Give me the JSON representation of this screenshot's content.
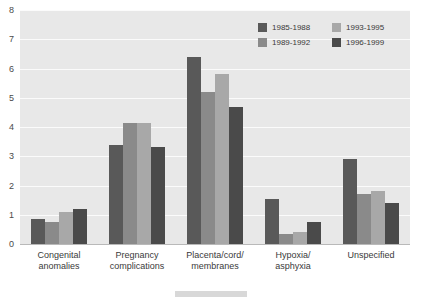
{
  "chart_data": {
    "type": "bar",
    "title": "",
    "subtitle": "",
    "xlabel": "",
    "ylabel": "",
    "ylim": [
      0,
      8
    ],
    "ytick_labels": [
      "8",
      "7",
      "6",
      "5",
      "4",
      "3",
      "2",
      "1",
      "0"
    ],
    "yticks": [
      8,
      7,
      6,
      5,
      4,
      3,
      2,
      1,
      0
    ],
    "grid": true,
    "legend_position": "top-right",
    "categories": [
      "Congenital\nanomalies",
      "Pregnancy\ncomplications",
      "Placenta/cord/\nmembranes",
      "Hypoxia/\nasphyxia",
      "Unspecified"
    ],
    "series": [
      {
        "name": "1985-1988",
        "color": "#595959",
        "values": [
          0.85,
          3.4,
          6.4,
          1.55,
          2.9
        ]
      },
      {
        "name": "1989-1992",
        "color": "#8a8a8a",
        "values": [
          0.75,
          4.15,
          5.2,
          0.35,
          1.7
        ]
      },
      {
        "name": "1993-1995",
        "color": "#a8a8a8",
        "values": [
          1.1,
          4.15,
          5.8,
          0.4,
          1.8
        ]
      },
      {
        "name": "1996-1999",
        "color": "#4a4a4a",
        "values": [
          1.2,
          3.3,
          4.7,
          0.75,
          1.4
        ]
      }
    ]
  },
  "legend": {
    "items": [
      {
        "label": "1985-1988",
        "color": "#595959"
      },
      {
        "label": "1993-1995",
        "color": "#a8a8a8"
      },
      {
        "label": "1989-1992",
        "color": "#8a8a8a"
      },
      {
        "label": "1996-1999",
        "color": "#4a4a4a"
      }
    ]
  },
  "colors": {
    "plot_background": "#e8e8e8",
    "page_background": "#ffffff",
    "gridline": "#fbfbfb",
    "axis_text": "#3a3a3a",
    "baseline": "#b9b9b9"
  }
}
